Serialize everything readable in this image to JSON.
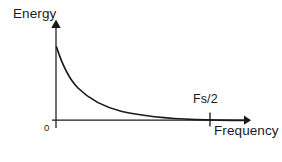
{
  "figure": {
    "title_visible": false,
    "background_color": "#ffffff",
    "ink_color": "#1a1a1a",
    "width": 282,
    "height": 162
  },
  "axes": {
    "y_axis": {
      "label": "Energy",
      "has_arrow": true,
      "arrow_direction": "up",
      "origin_px": {
        "x": 56,
        "y": 120
      },
      "tip_px": {
        "x": 56,
        "y": 20
      }
    },
    "x_axis": {
      "label": "Frequency",
      "has_arrow": true,
      "arrow_direction": "right",
      "origin_px": {
        "x": 52,
        "y": 120
      },
      "tip_px": {
        "x": 250,
        "y": 120
      }
    },
    "origin_label": "0",
    "ticks": [
      {
        "label": "Fs/2",
        "x_px": 210,
        "axis": "x"
      }
    ]
  },
  "chart_data": {
    "type": "line",
    "title": "",
    "xlabel": "Frequency",
    "ylabel": "Energy",
    "xlim": [
      0,
      1
    ],
    "ylim": [
      0,
      1
    ],
    "grid": false,
    "legend": false,
    "annotations": [
      {
        "text": "Fs/2",
        "x": 0.78,
        "y": 0.0,
        "tick": true
      },
      {
        "text": "0",
        "x": 0.0,
        "y": 0.0,
        "tick": false
      }
    ],
    "series": [
      {
        "name": "energy-decay",
        "description": "Monotonically decreasing energy spectrum decaying toward zero near Fs/2",
        "color": "#1a1a1a",
        "x": [
          0.0,
          0.02,
          0.04,
          0.06,
          0.09,
          0.12,
          0.16,
          0.2,
          0.25,
          0.31,
          0.38,
          0.46,
          0.55,
          0.65,
          0.75,
          0.85,
          1.0
        ],
        "y": [
          1.0,
          0.86,
          0.74,
          0.64,
          0.53,
          0.45,
          0.36,
          0.3,
          0.24,
          0.18,
          0.14,
          0.1,
          0.07,
          0.045,
          0.025,
          0.012,
          0.004
        ]
      }
    ]
  },
  "geometry": {
    "curve_path": "M 56.5 47 C 62 64, 68 78, 78 88 C 90 100, 104 107, 122 111.5 C 142 116, 168 118.5, 196 119.6 C 212 120.1, 232 120.3, 249 120.4",
    "x_axis_path": "M 52 120.2 L 244 120.2",
    "y_axis_path": "M 56 128 L 56 27",
    "tick_path": "M 210 112.5 L 210 126.5",
    "x_arrow_points": "244,115.6 251,120.2 244,124.8",
    "y_arrow_points": "51.3,28 56,19.5 60.7,28"
  }
}
